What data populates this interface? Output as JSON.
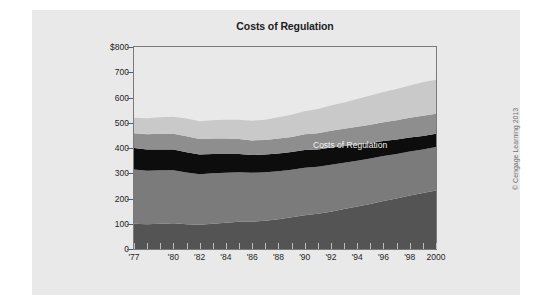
{
  "figure": {
    "credit": "© Cengage Learning 2013",
    "panel_color": "#e9e9e9",
    "background_color": "#ffffff"
  },
  "colors": {
    "environmental_regulation": "#c9c9c9",
    "other_social_regulation": "#8e8e8e",
    "economic_regulation_efficiency_costs": "#0d0d0d",
    "economic_regulation_transfer_costs": "#7b7b7b",
    "paperwork": "#545454",
    "frame": "#7a7a7a",
    "text": "#1f1f1f",
    "annotation_text": "#f2f2f2"
  },
  "legend": {
    "left_column": [
      {
        "label": "Environmental Regulation",
        "color": "#c9c9c9",
        "swatch": "legend-swatch-environmental"
      },
      {
        "label": "Other Social Regulation",
        "color": "#8e8e8e",
        "swatch": "legend-swatch-other-social"
      },
      {
        "label": "Economic Regulation",
        "label_line2": "Efficiency Costs",
        "color": "#0d0d0d",
        "swatch": "legend-swatch-efficiency"
      }
    ],
    "right_column": [
      {
        "label": "Economic Regulation",
        "label_line2": "Transfer Costs",
        "color": "#7b7b7b",
        "swatch": "legend-swatch-transfer"
      },
      {
        "label": "Paperwork",
        "color": "#545454",
        "swatch": "legend-swatch-paperwork"
      }
    ]
  },
  "chart_data": {
    "type": "area",
    "stacked": true,
    "title": "Costs of Regulation",
    "xlabel": "",
    "ylabel": "",
    "ylim": [
      0,
      800
    ],
    "yticks": [
      0,
      100,
      200,
      300,
      400,
      500,
      600,
      700,
      800
    ],
    "ytick_labels": [
      "0",
      "100",
      "200",
      "300",
      "400",
      "500",
      "600",
      "700",
      "$800"
    ],
    "grid": false,
    "legend_position": "top-inside",
    "annotation": "Costs of Regulation",
    "xlim": [
      1977,
      2000
    ],
    "x": [
      1977,
      1978,
      1979,
      1980,
      1981,
      1982,
      1983,
      1984,
      1985,
      1986,
      1987,
      1988,
      1989,
      1990,
      1991,
      1992,
      1993,
      1994,
      1995,
      1996,
      1997,
      1998,
      1999,
      2000
    ],
    "xtick_values": [
      1977,
      1980,
      1982,
      1984,
      1986,
      1988,
      1990,
      1992,
      1994,
      1996,
      1998,
      2000
    ],
    "xtick_labels": [
      "'77",
      "'80",
      "'82",
      "'84",
      "'86",
      "'88",
      "'90",
      "'92",
      "'94",
      "'96",
      "'98",
      "2000"
    ],
    "units": "billions of dollars",
    "series": [
      {
        "name": "Paperwork",
        "color": "#545454",
        "values": [
          100,
          98,
          100,
          102,
          98,
          96,
          100,
          104,
          108,
          108,
          112,
          118,
          126,
          134,
          140,
          148,
          158,
          168,
          178,
          190,
          200,
          212,
          222,
          232
        ]
      },
      {
        "name": "Economic Regulation Transfer Costs",
        "color": "#7b7b7b",
        "values": [
          215,
          212,
          212,
          210,
          205,
          200,
          200,
          198,
          196,
          194,
          192,
          190,
          188,
          188,
          186,
          186,
          184,
          182,
          180,
          178,
          176,
          174,
          172,
          172
        ]
      },
      {
        "name": "Economic Regulation Efficiency Costs",
        "color": "#0d0d0d",
        "values": [
          85,
          84,
          82,
          82,
          80,
          78,
          76,
          74,
          72,
          70,
          70,
          70,
          70,
          70,
          68,
          68,
          66,
          64,
          62,
          60,
          58,
          56,
          54,
          52
        ]
      },
      {
        "name": "Other Social Regulation",
        "color": "#8e8e8e",
        "values": [
          58,
          60,
          62,
          62,
          64,
          62,
          62,
          62,
          60,
          58,
          58,
          60,
          60,
          62,
          64,
          66,
          68,
          70,
          72,
          74,
          76,
          78,
          80,
          80
        ]
      },
      {
        "name": "Environmental Regulation",
        "color": "#c9c9c9",
        "values": [
          62,
          64,
          66,
          68,
          70,
          70,
          72,
          74,
          76,
          78,
          80,
          84,
          88,
          92,
          96,
          100,
          104,
          110,
          116,
          120,
          124,
          128,
          132,
          134
        ]
      }
    ],
    "totals": [
      520,
      518,
      522,
      524,
      517,
      506,
      510,
      512,
      512,
      508,
      512,
      522,
      532,
      546,
      554,
      568,
      580,
      594,
      608,
      622,
      634,
      648,
      660,
      670
    ]
  }
}
